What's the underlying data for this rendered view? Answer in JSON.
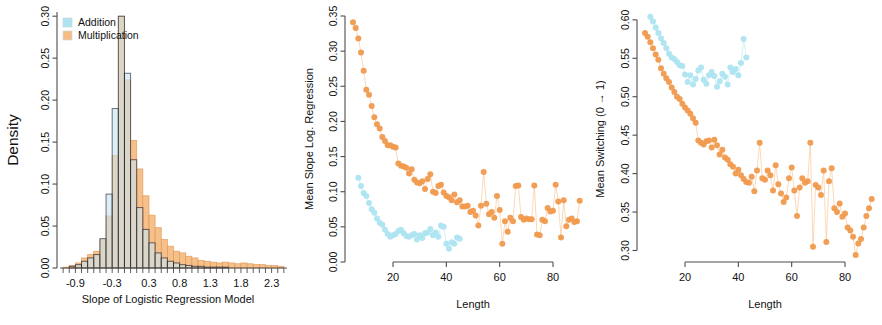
{
  "figure": {
    "panel_count": 3,
    "colors": {
      "addition": "#ade4f0",
      "addition_line": "#bfe9f3",
      "multiplication": "#f09a4e",
      "multiplication_line": "#f7c697",
      "multiplication_fill": "#f5bd84",
      "addition_fill": "#c8e6f2",
      "addition_border": "#1a1a2e",
      "axis": "#4d4d4d"
    }
  },
  "legend": {
    "items": [
      {
        "label": "Addition",
        "color": "#ade4f0"
      },
      {
        "label": "Multiplication",
        "color": "#f5bd84"
      }
    ]
  },
  "chart_data": [
    {
      "type": "bar",
      "panel": 1,
      "title": "",
      "xlabel": "Slope of Logistic Regression Model",
      "ylabel": "Density",
      "xlim": [
        -1.2,
        2.6
      ],
      "ylim": [
        0.0,
        0.305
      ],
      "xticks": [
        -0.9,
        -0.3,
        0.3,
        0.8,
        1.3,
        1.8,
        2.3
      ],
      "xticklabels": [
        "-0.9",
        "-0.3",
        "0.3",
        "0.8",
        "1.3",
        "1.8",
        "2.3"
      ],
      "yticks": [
        0.0,
        0.05,
        0.1,
        0.15,
        0.2,
        0.25,
        0.3
      ],
      "yticklabels": [
        "0.00",
        "0.05",
        "0.10",
        "0.15",
        "0.20",
        "0.25",
        "0.30"
      ],
      "grid": false,
      "legend_position": "top-left",
      "bin_width": 0.1,
      "bin_starts": [
        -1.1,
        -1.0,
        -0.9,
        -0.8,
        -0.7,
        -0.6,
        -0.5,
        -0.4,
        -0.3,
        -0.2,
        -0.1,
        0.0,
        0.1,
        0.2,
        0.3,
        0.4,
        0.5,
        0.6,
        0.7,
        0.8,
        0.9,
        1.0,
        1.1,
        1.2,
        1.3,
        1.4,
        1.5,
        1.6,
        1.7,
        1.8,
        1.9,
        2.0,
        2.1,
        2.2,
        2.3,
        2.4
      ],
      "series": [
        {
          "name": "Addition",
          "values": [
            0.0,
            0.002,
            0.004,
            0.008,
            0.012,
            0.016,
            0.035,
            0.088,
            0.19,
            0.3,
            0.232,
            0.129,
            0.072,
            0.046,
            0.03,
            0.018,
            0.012,
            0.008,
            0.006,
            0.004,
            0.003,
            0.002,
            0.002,
            0.001,
            0.001,
            0.001,
            0.001,
            0.0,
            0.0,
            0.0,
            0.0,
            0.0,
            0.0,
            0.0,
            0.0,
            0.0
          ]
        },
        {
          "name": "Multiplication",
          "values": [
            0.001,
            0.003,
            0.006,
            0.012,
            0.016,
            0.02,
            0.034,
            0.062,
            0.134,
            0.3,
            0.224,
            0.152,
            0.118,
            0.086,
            0.063,
            0.048,
            0.034,
            0.026,
            0.02,
            0.018,
            0.014,
            0.012,
            0.009,
            0.008,
            0.007,
            0.006,
            0.007,
            0.006,
            0.005,
            0.006,
            0.005,
            0.004,
            0.004,
            0.003,
            0.003,
            0.002
          ]
        }
      ]
    },
    {
      "type": "scatter",
      "panel": 2,
      "title": "",
      "xlabel": "Length",
      "ylabel": "Mean Slope Log. Regression",
      "xlim": [
        2,
        92
      ],
      "ylim": [
        0.0,
        0.35
      ],
      "xticks": [
        20,
        40,
        60,
        80
      ],
      "xticklabels": [
        "20",
        "40",
        "60",
        "80"
      ],
      "yticks": [
        0.0,
        0.05,
        0.1,
        0.15,
        0.2,
        0.25,
        0.3,
        0.35
      ],
      "yticklabels": [
        "0.00",
        "0.05",
        "0.10",
        "0.15",
        "0.20",
        "0.25",
        "0.30",
        "0.35"
      ],
      "grid": false,
      "connected": true,
      "series": [
        {
          "name": "Multiplication",
          "color": "#f09a4e",
          "x": [
            5,
            6,
            7,
            8,
            9,
            10,
            11,
            12,
            13,
            14,
            15,
            16,
            17,
            18,
            19,
            20,
            21,
            22,
            23,
            24,
            25,
            26,
            27,
            28,
            29,
            30,
            31,
            32,
            33,
            34,
            35,
            36,
            37,
            38,
            39,
            40,
            41,
            42,
            43,
            44,
            45,
            46,
            47,
            48,
            49,
            50,
            51,
            52,
            53,
            54,
            55,
            56,
            57,
            58,
            59,
            60,
            61,
            62,
            63,
            64,
            65,
            66,
            67,
            68,
            69,
            70,
            71,
            72,
            73,
            74,
            75,
            76,
            77,
            78,
            79,
            80,
            81,
            82,
            83,
            84,
            85,
            86,
            87,
            88,
            89,
            90
          ],
          "y": [
            0.341,
            0.333,
            0.318,
            0.298,
            0.272,
            0.245,
            0.238,
            0.222,
            0.206,
            0.196,
            0.19,
            0.178,
            0.172,
            0.166,
            0.166,
            0.164,
            0.163,
            0.14,
            0.137,
            0.136,
            0.134,
            0.126,
            0.132,
            0.117,
            0.113,
            0.112,
            0.115,
            0.104,
            0.118,
            0.125,
            0.1,
            0.098,
            0.108,
            0.11,
            0.099,
            0.094,
            0.092,
            0.088,
            0.096,
            0.085,
            0.088,
            0.079,
            0.079,
            0.08,
            0.071,
            0.073,
            0.066,
            0.052,
            0.08,
            0.128,
            0.083,
            0.068,
            0.071,
            0.063,
            0.094,
            0.074,
            0.026,
            0.058,
            0.043,
            0.063,
            0.058,
            0.108,
            0.109,
            0.064,
            0.06,
            0.062,
            0.061,
            0.061,
            0.109,
            0.039,
            0.038,
            0.06,
            0.058,
            0.077,
            0.072,
            0.073,
            0.11,
            0.086,
            0.035,
            0.088,
            0.051,
            0.06,
            0.062,
            0.057,
            0.058,
            0.087
          ]
        },
        {
          "name": "Addition",
          "color": "#ade4f0",
          "x": [
            7,
            8,
            9,
            10,
            11,
            12,
            13,
            14,
            15,
            16,
            17,
            18,
            19,
            20,
            21,
            22,
            23,
            24,
            25,
            26,
            27,
            28,
            29,
            30,
            31,
            32,
            33,
            34,
            35,
            36,
            37,
            38,
            39,
            40,
            41,
            42,
            43,
            44,
            45
          ],
          "y": [
            0.12,
            0.108,
            0.098,
            0.094,
            0.084,
            0.075,
            0.07,
            0.062,
            0.056,
            0.053,
            0.046,
            0.04,
            0.036,
            0.038,
            0.04,
            0.044,
            0.046,
            0.041,
            0.037,
            0.036,
            0.038,
            0.04,
            0.032,
            0.038,
            0.034,
            0.041,
            0.042,
            0.047,
            0.038,
            0.042,
            0.036,
            0.052,
            0.05,
            0.026,
            0.019,
            0.028,
            0.026,
            0.035,
            0.033
          ]
        }
      ]
    },
    {
      "type": "scatter",
      "panel": 3,
      "title": "",
      "xlabel": "Length",
      "ylabel": "Mean Switching (0 → 1)",
      "xlim": [
        2,
        92
      ],
      "ylim": [
        0.285,
        0.605
      ],
      "xticks": [
        20,
        40,
        60,
        80
      ],
      "xticklabels": [
        "20",
        "40",
        "60",
        "80"
      ],
      "yticks": [
        0.3,
        0.35,
        0.4,
        0.45,
        0.5,
        0.55,
        0.6
      ],
      "yticklabels": [
        "0.30",
        "0.35",
        "0.40",
        "0.45",
        "0.50",
        "0.55",
        "0.60"
      ],
      "grid": false,
      "connected": true,
      "series": [
        {
          "name": "Multiplication",
          "color": "#f09a4e",
          "x": [
            5,
            6,
            7,
            8,
            9,
            10,
            11,
            12,
            13,
            14,
            15,
            16,
            17,
            18,
            19,
            20,
            21,
            22,
            23,
            24,
            25,
            26,
            27,
            28,
            29,
            30,
            31,
            32,
            33,
            34,
            35,
            36,
            37,
            38,
            39,
            40,
            41,
            42,
            43,
            44,
            45,
            46,
            47,
            48,
            49,
            50,
            51,
            52,
            53,
            54,
            55,
            56,
            57,
            58,
            59,
            60,
            61,
            62,
            63,
            64,
            65,
            66,
            67,
            68,
            69,
            70,
            71,
            72,
            73,
            74,
            75,
            76,
            77,
            78,
            79,
            80,
            81,
            82,
            83,
            84,
            85,
            86,
            87,
            88,
            89,
            90
          ],
          "y": [
            0.583,
            0.578,
            0.571,
            0.563,
            0.555,
            0.548,
            0.537,
            0.53,
            0.524,
            0.519,
            0.512,
            0.506,
            0.5,
            0.497,
            0.491,
            0.486,
            0.482,
            0.478,
            0.472,
            0.466,
            0.443,
            0.44,
            0.438,
            0.442,
            0.443,
            0.434,
            0.444,
            0.437,
            0.425,
            0.431,
            0.421,
            0.418,
            0.412,
            0.409,
            0.4,
            0.405,
            0.398,
            0.393,
            0.389,
            0.388,
            0.396,
            0.377,
            0.404,
            0.44,
            0.394,
            0.392,
            0.404,
            0.398,
            0.378,
            0.411,
            0.386,
            0.374,
            0.363,
            0.369,
            0.394,
            0.408,
            0.378,
            0.345,
            0.382,
            0.394,
            0.388,
            0.39,
            0.44,
            0.305,
            0.385,
            0.382,
            0.372,
            0.404,
            0.311,
            0.39,
            0.407,
            0.355,
            0.35,
            0.361,
            0.344,
            0.348,
            0.33,
            0.326,
            0.318,
            0.294,
            0.309,
            0.315,
            0.33,
            0.345,
            0.355,
            0.367
          ]
        },
        {
          "name": "Addition",
          "color": "#ade4f0",
          "x": [
            7,
            8,
            9,
            10,
            11,
            12,
            13,
            14,
            15,
            16,
            17,
            18,
            19,
            20,
            21,
            22,
            23,
            24,
            25,
            26,
            27,
            28,
            29,
            30,
            31,
            32,
            33,
            34,
            35,
            36,
            37,
            38,
            39,
            40,
            41,
            42,
            43
          ],
          "y": [
            0.604,
            0.598,
            0.59,
            0.583,
            0.576,
            0.57,
            0.563,
            0.556,
            0.551,
            0.549,
            0.545,
            0.541,
            0.54,
            0.529,
            0.519,
            0.528,
            0.516,
            0.523,
            0.534,
            0.538,
            0.522,
            0.517,
            0.528,
            0.532,
            0.527,
            0.513,
            0.52,
            0.53,
            0.526,
            0.516,
            0.538,
            0.532,
            0.536,
            0.528,
            0.544,
            0.575,
            0.551
          ]
        }
      ]
    }
  ]
}
